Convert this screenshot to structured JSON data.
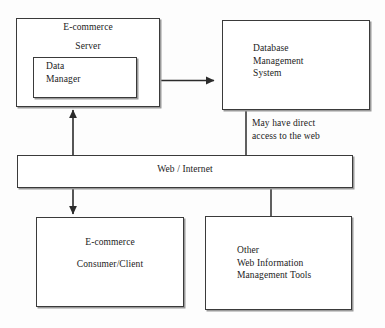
{
  "diagram": {
    "line_color": "#3a3a3a",
    "text_color": "#1b1b1b",
    "background": "#fdfdfd",
    "nodes": {
      "server": {
        "title": "E-commerce",
        "subtitle": "Server"
      },
      "data_manager": {
        "label": "Data\nManager"
      },
      "dbms": {
        "label": "Database\nManagement\nSystem"
      },
      "web": {
        "label": "Web / Internet"
      },
      "consumer": {
        "title": "E-commerce",
        "subtitle": "Consumer/Client"
      },
      "other_tools": {
        "label": "Other\nWeb Information\nManagement Tools"
      }
    },
    "annotations": {
      "direct_access": "May have direct\naccess to the web"
    },
    "connectors": [
      {
        "name": "data-manager-to-dbms",
        "type": "double-arrow",
        "orientation": "horizontal"
      },
      {
        "name": "web-to-server",
        "type": "single-arrow",
        "orientation": "vertical-up"
      },
      {
        "name": "web-to-consumer",
        "type": "single-arrow",
        "orientation": "vertical-down"
      },
      {
        "name": "dbms-to-web",
        "type": "line",
        "orientation": "vertical"
      },
      {
        "name": "web-to-other-tools",
        "type": "line",
        "orientation": "vertical"
      }
    ]
  }
}
